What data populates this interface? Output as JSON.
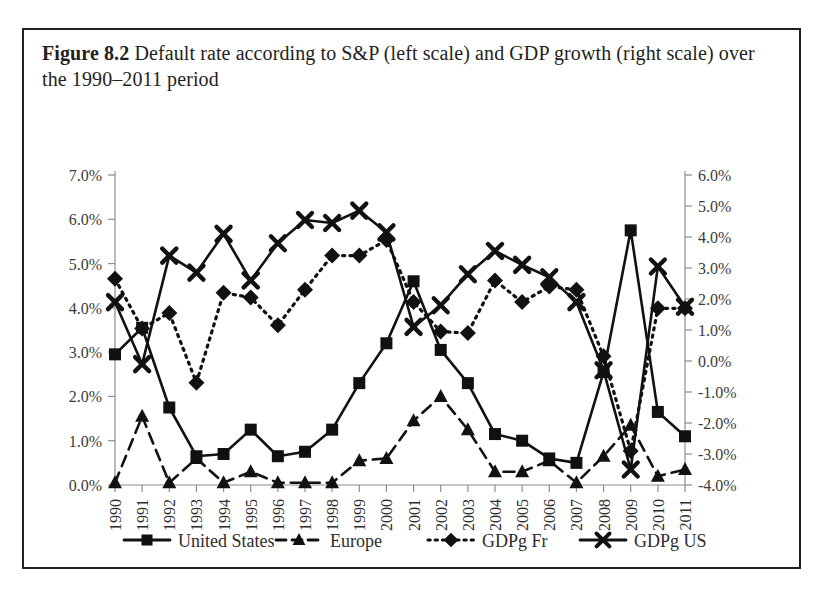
{
  "caption": {
    "figure_tag": "Figure 8.2",
    "text": "Default rate according to S&P (left scale) and GDP growth (right scale) over the 1990–2011 period"
  },
  "chart_data": {
    "type": "line",
    "title": "Default rate according to S&P (left scale) and GDP growth (right scale) over the 1990–2011 period",
    "xlabel": "",
    "ylabel": "",
    "grid": false,
    "legend_position": "bottom",
    "x": [
      1990,
      1991,
      1992,
      1993,
      1994,
      1995,
      1996,
      1997,
      1998,
      1999,
      2000,
      2001,
      2002,
      2003,
      2004,
      2005,
      2006,
      2007,
      2008,
      2009,
      2010,
      2011
    ],
    "categories": [
      "1990",
      "1991",
      "1992",
      "1993",
      "1994",
      "1995",
      "1996",
      "1997",
      "1998",
      "1999",
      "2000",
      "2001",
      "2002",
      "2003",
      "2004",
      "2005",
      "2006",
      "2007",
      "2008",
      "2009",
      "2010",
      "2011"
    ],
    "left_axis": {
      "label": "Default rate (S&P)",
      "ylim": [
        0.0,
        7.0
      ],
      "ticks": [
        0.0,
        1.0,
        2.0,
        3.0,
        4.0,
        5.0,
        6.0,
        7.0
      ],
      "tick_labels": [
        "0.0%",
        "1.0%",
        "2.0%",
        "3.0%",
        "4.0%",
        "5.0%",
        "6.0%",
        "7.0%"
      ]
    },
    "right_axis": {
      "label": "GDP growth",
      "ylim": [
        -4.0,
        6.0
      ],
      "ticks": [
        -4.0,
        -3.0,
        -2.0,
        -1.0,
        0.0,
        1.0,
        2.0,
        3.0,
        4.0,
        5.0,
        6.0
      ],
      "tick_labels": [
        "-4.0%",
        "-3.0%",
        "-2.0%",
        "-1.0%",
        "0.0%",
        "1.0%",
        "2.0%",
        "3.0%",
        "4.0%",
        "5.0%",
        "6.0%"
      ]
    },
    "series": [
      {
        "name": "United States",
        "axis": "left",
        "marker": "square",
        "line_style": "solid",
        "values": [
          2.95,
          3.55,
          1.75,
          0.65,
          0.7,
          1.25,
          0.65,
          0.75,
          1.25,
          2.3,
          3.2,
          4.6,
          3.05,
          2.3,
          1.15,
          1.0,
          0.6,
          0.5,
          2.55,
          5.75,
          1.65,
          1.1
        ]
      },
      {
        "name": "Europe",
        "axis": "left",
        "marker": "triangle",
        "line_style": "dashed",
        "values": [
          0.05,
          1.55,
          0.05,
          0.6,
          0.05,
          0.3,
          0.05,
          0.05,
          0.05,
          0.55,
          0.6,
          1.45,
          2.0,
          1.25,
          0.3,
          0.3,
          0.55,
          0.05,
          0.65,
          1.35,
          0.2,
          0.35
        ]
      },
      {
        "name": "GDPg Fr",
        "axis": "right",
        "marker": "diamond",
        "line_style": "dotted",
        "values": [
          2.65,
          1.05,
          1.55,
          -0.7,
          2.2,
          2.05,
          1.15,
          2.3,
          3.4,
          3.4,
          3.9,
          1.9,
          0.95,
          0.9,
          2.6,
          1.9,
          2.4,
          2.3,
          0.15,
          -2.9,
          1.7,
          1.7
        ]
      },
      {
        "name": "GDPg US",
        "axis": "right",
        "marker": "cross",
        "line_style": "solid",
        "values": [
          1.9,
          -0.1,
          3.4,
          2.85,
          4.1,
          2.6,
          3.8,
          4.55,
          4.45,
          4.85,
          4.15,
          1.1,
          1.8,
          2.8,
          3.55,
          3.1,
          2.7,
          1.9,
          -0.3,
          -3.5,
          3.05,
          1.75
        ]
      }
    ],
    "legend": [
      {
        "label": "United States",
        "marker": "square",
        "line_style": "solid"
      },
      {
        "label": "Europe",
        "marker": "triangle",
        "line_style": "dashed"
      },
      {
        "label": "GDPg Fr",
        "marker": "diamond",
        "line_style": "dotted"
      },
      {
        "label": "GDPg US",
        "marker": "cross",
        "line_style": "solid"
      }
    ]
  }
}
